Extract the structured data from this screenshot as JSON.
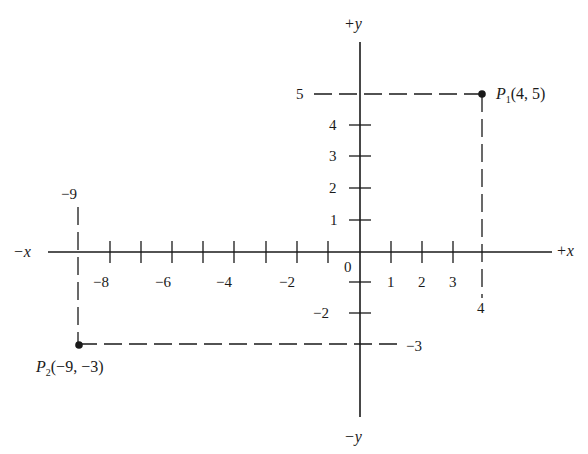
{
  "diagram": {
    "title": "",
    "colors": {
      "ink": "#1a1a1a",
      "background": "#ffffff"
    },
    "axes": {
      "x_positive_label": "+x",
      "x_negative_label": "−x",
      "y_positive_label": "+y",
      "y_negative_label": "−y",
      "origin_label": "0"
    },
    "x_ticks": {
      "range": [
        -9,
        4
      ],
      "labeled": [
        {
          "value": -8,
          "label": "−8"
        },
        {
          "value": -6,
          "label": "−6"
        },
        {
          "value": -4,
          "label": "−4"
        },
        {
          "value": -2,
          "label": "−2"
        },
        {
          "value": 1,
          "label": "1"
        },
        {
          "value": 2,
          "label": "2"
        },
        {
          "value": 3,
          "label": "3"
        }
      ]
    },
    "y_ticks": {
      "range": [
        -3,
        5
      ],
      "labeled": [
        {
          "value": 4,
          "label": "4"
        },
        {
          "value": 3,
          "label": "3"
        },
        {
          "value": 2,
          "label": "2"
        },
        {
          "value": 1,
          "label": "1"
        },
        {
          "value": -2,
          "label": "−2"
        }
      ]
    },
    "guide_labels": {
      "p1_y": "5",
      "p1_x": "4",
      "p2_x": "−9",
      "p2_y": "−3"
    },
    "points": [
      {
        "id": "P1",
        "name": "P",
        "subscript": "1",
        "coords": "(4, 5)",
        "x": 4,
        "y": 5
      },
      {
        "id": "P2",
        "name": "P",
        "subscript": "2",
        "coords": "(−9, −3)",
        "x": -9,
        "y": -3
      }
    ]
  }
}
